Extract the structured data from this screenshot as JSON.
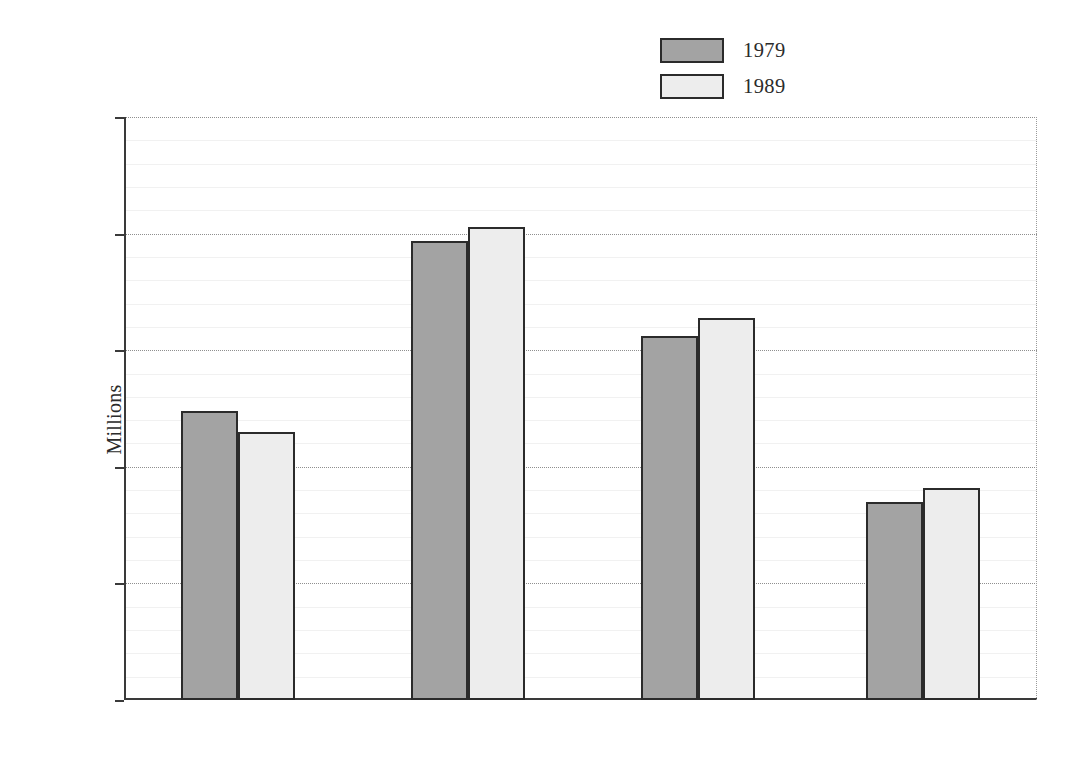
{
  "chart_data": {
    "type": "bar",
    "title": "",
    "subtitle": "",
    "xlabel": "",
    "ylabel": "Millions",
    "categories": [
      "Under 16",
      "16–39",
      "40–84",
      "85 and over"
    ],
    "series": [
      {
        "name": "1979",
        "color": "#a3a3a3",
        "values": [
          12.4,
          19.7,
          15.6,
          8.5
        ]
      },
      {
        "name": "1989",
        "color": "#ededed",
        "values": [
          11.5,
          20.3,
          16.4,
          9.1
        ]
      }
    ],
    "ylim": [
      0,
      25
    ],
    "ytick_labels": [
      "0",
      "5",
      "10",
      "15",
      "20",
      "25"
    ],
    "ytick_values": [
      0,
      5,
      10,
      15,
      20,
      25
    ],
    "minor_tick_step": 1,
    "grid": "horizontal-major-dotted-minor-faint",
    "legend_position": "top-right",
    "bar_outline_color": "#2b2b2b",
    "axis_color": "#3a3a3a"
  },
  "legend": {
    "entries": [
      {
        "label": "1979"
      },
      {
        "label": "1989"
      }
    ]
  },
  "axes": {
    "y_title": "Millions"
  }
}
